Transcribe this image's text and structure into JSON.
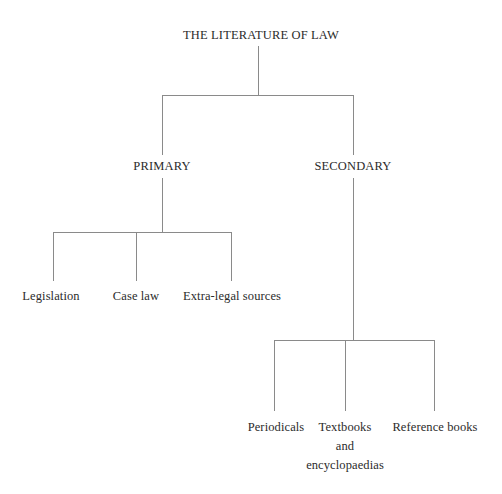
{
  "diagram": {
    "type": "tree",
    "title": "THE LITERATURE OF LAW",
    "colors": {
      "background": "#ffffff",
      "text": "#2b2b2b",
      "connector": "#8a8a8a"
    },
    "root": {
      "label": "THE LITERATURE OF LAW"
    },
    "branches": [
      {
        "label": "PRIMARY",
        "children": [
          {
            "label": "Legislation"
          },
          {
            "label": "Case law"
          },
          {
            "label": "Extra-legal sources"
          }
        ]
      },
      {
        "label": "SECONDARY",
        "children": [
          {
            "label": "Periodicals"
          },
          {
            "label": "Textbooks",
            "line2": "and",
            "line3": "encyclopaedias"
          },
          {
            "label": "Reference books"
          }
        ]
      }
    ],
    "nodes": {
      "root": "THE LITERATURE OF LAW",
      "primary": "PRIMARY",
      "secondary": "SECONDARY",
      "legislation": "Legislation",
      "case_law": "Case law",
      "extra_legal": "Extra-legal sources",
      "periodicals": "Periodicals",
      "textbooks_l1": "Textbooks",
      "textbooks_l2": "and",
      "textbooks_l3": "encyclopaedias",
      "reference_books": "Reference books"
    }
  }
}
